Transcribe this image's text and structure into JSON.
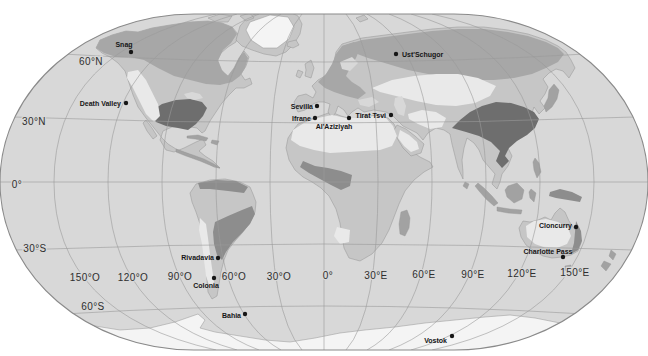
{
  "map": {
    "colors": {
      "ocean": "#d8d8d8",
      "land": "#c6c6c6",
      "coast": "#949494",
      "boreal": "#a7a7a7",
      "dark": "#6e6e6e",
      "dark2": "#8d8d8d",
      "mid": "#a2a2a2",
      "pale": "#e9e9e9",
      "ice": "#f4f4f4",
      "graticule": "#9b9b9b",
      "outline": "#8a8a8a",
      "labeltext": "#2e2e2e",
      "citytext": "#161616"
    },
    "graticule_labels": {
      "latitudes": [
        {
          "text": "60°N",
          "x": 91,
          "y": 65
        },
        {
          "text": "30°N",
          "x": 34,
          "y": 125
        },
        {
          "text": "0°",
          "x": 17,
          "y": 188
        },
        {
          "text": "30°S",
          "x": 35,
          "y": 252
        },
        {
          "text": "60°S",
          "x": 93,
          "y": 310
        }
      ],
      "longitudes": [
        {
          "text": "150°O",
          "x": 85,
          "y": 281
        },
        {
          "text": "120°O",
          "x": 133,
          "y": 281
        },
        {
          "text": "90°O",
          "x": 180,
          "y": 280
        },
        {
          "text": "60°O",
          "x": 234,
          "y": 280
        },
        {
          "text": "30°O",
          "x": 279,
          "y": 280
        },
        {
          "text": "0°",
          "x": 328,
          "y": 279
        },
        {
          "text": "30°E",
          "x": 376,
          "y": 279
        },
        {
          "text": "60°E",
          "x": 424,
          "y": 278
        },
        {
          "text": "90°E",
          "x": 473,
          "y": 278
        },
        {
          "text": "120°E",
          "x": 522,
          "y": 277
        },
        {
          "text": "150°E",
          "x": 575,
          "y": 276
        }
      ]
    },
    "stations": [
      {
        "name": "Snag",
        "dot": {
          "x": 131,
          "y": 52
        },
        "label": {
          "x": 124,
          "y": 47,
          "anchor": "middle"
        }
      },
      {
        "name": "Death Valley",
        "dot": {
          "x": 126,
          "y": 103
        },
        "label": {
          "x": 121,
          "y": 106,
          "anchor": "end"
        }
      },
      {
        "name": "Ust'Schugor",
        "dot": {
          "x": 396,
          "y": 54
        },
        "label": {
          "x": 402,
          "y": 57,
          "anchor": "start"
        }
      },
      {
        "name": "Sevilla",
        "dot": {
          "x": 317,
          "y": 106
        },
        "label": {
          "x": 313,
          "y": 109,
          "anchor": "end"
        }
      },
      {
        "name": "Ifrane",
        "dot": {
          "x": 315,
          "y": 118
        },
        "label": {
          "x": 311,
          "y": 121,
          "anchor": "end"
        }
      },
      {
        "name": "Al'Aziziyah",
        "dot": {
          "x": 349,
          "y": 118
        },
        "label": {
          "x": 334,
          "y": 129,
          "anchor": "middle"
        }
      },
      {
        "name": "Tirat Tsvi",
        "dot": {
          "x": 391,
          "y": 115
        },
        "label": {
          "x": 386,
          "y": 118,
          "anchor": "end"
        }
      },
      {
        "name": "Cloncurry",
        "dot": {
          "x": 576,
          "y": 227
        },
        "label": {
          "x": 572,
          "y": 228,
          "anchor": "end"
        }
      },
      {
        "name": "Charlotte Pass",
        "dot": {
          "x": 563,
          "y": 257
        },
        "label": {
          "x": 548,
          "y": 254,
          "anchor": "middle"
        }
      },
      {
        "name": "Rivadavia",
        "dot": {
          "x": 218,
          "y": 258
        },
        "label": {
          "x": 214,
          "y": 260,
          "anchor": "end"
        }
      },
      {
        "name": "Colonia",
        "dot": {
          "x": 214,
          "y": 278
        },
        "label": {
          "x": 206,
          "y": 288,
          "anchor": "middle"
        }
      },
      {
        "name": "Bahia",
        "dot": {
          "x": 245,
          "y": 314
        },
        "label": {
          "x": 241,
          "y": 318,
          "anchor": "end"
        }
      },
      {
        "name": "Vostok",
        "dot": {
          "x": 452,
          "y": 336
        },
        "label": {
          "x": 447,
          "y": 343,
          "anchor": "end"
        }
      }
    ]
  }
}
